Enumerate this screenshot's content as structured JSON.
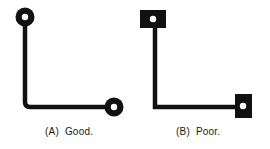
{
  "figure": {
    "panels": [
      {
        "id": "A",
        "caption": "(A)  Good.",
        "pad_shape": "round",
        "trace_corner": "rounded"
      },
      {
        "id": "B",
        "caption": "(B)  Poor.",
        "pad_shape": "square",
        "trace_corner": "sharp"
      }
    ],
    "colors": {
      "ink": "#111111",
      "hole": "#ffffff",
      "background": "#ffffff"
    }
  }
}
